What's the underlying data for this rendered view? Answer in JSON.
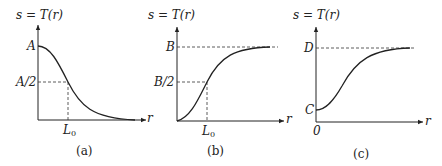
{
  "figure": {
    "panels": [
      {
        "id": "a",
        "y_axis_label": "s = T(r)",
        "x_axis_label": "r",
        "caption": "(a)",
        "y_ticks": [
          "A",
          "A/2"
        ],
        "x_ticks": [
          "L0"
        ],
        "x_tick_display": "L",
        "x_tick_sub": "0",
        "curve": "decreasing sigmoid from A toward 0"
      },
      {
        "id": "b",
        "y_axis_label": "s = T(r)",
        "x_axis_label": "r",
        "left_label": "r",
        "caption": "(b)",
        "y_ticks": [
          "B",
          "B/2"
        ],
        "x_ticks": [
          "L0"
        ],
        "x_tick_display": "L",
        "x_tick_sub": "0",
        "curve": "increasing sigmoid from 0 toward B"
      },
      {
        "id": "c",
        "y_axis_label": "s = T(r)",
        "x_axis_label": "r",
        "caption": "(c)",
        "y_ticks": [
          "D",
          "C"
        ],
        "x_ticks": [
          "0"
        ],
        "curve": "increasing sigmoid from C toward D"
      }
    ]
  }
}
